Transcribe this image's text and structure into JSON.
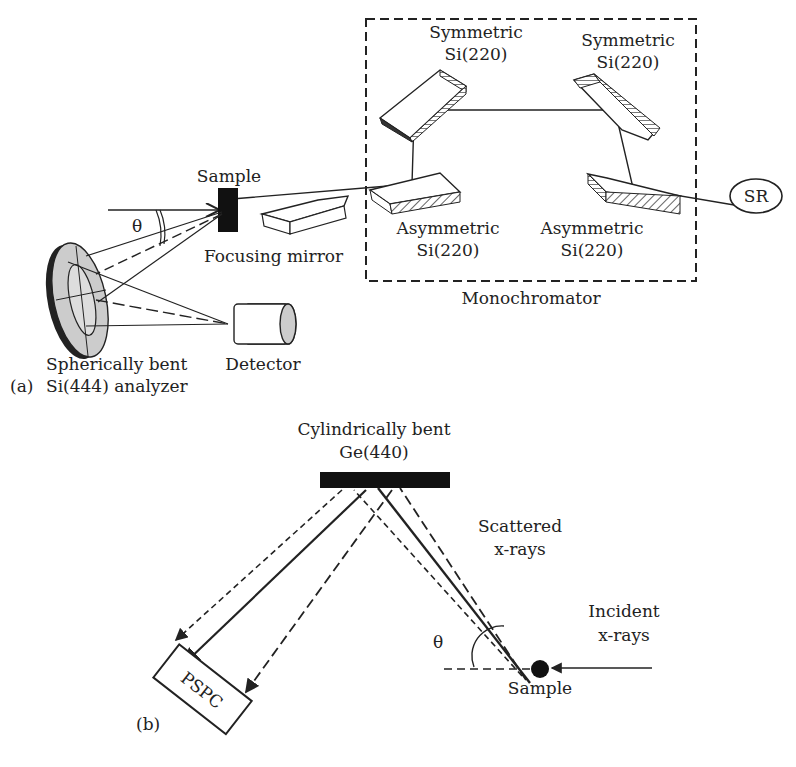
{
  "panel_a": {
    "tag": "(a)",
    "monochromator": {
      "title": "Monochromator",
      "sym1": [
        "Symmetric",
        "Si(220)"
      ],
      "sym2": [
        "Symmetric",
        "Si(220)"
      ],
      "asym1": [
        "Asymmetric",
        "Si(220)"
      ],
      "asym2": [
        "Asymmetric",
        "Si(220)"
      ]
    },
    "source": "SR",
    "sample": "Sample",
    "theta": "θ",
    "mirror": "Focusing  mirror",
    "detector": "Detector",
    "analyzer": [
      "Spherically bent",
      "Si(444) analyzer"
    ]
  },
  "panel_b": {
    "tag": "(b)",
    "crystal": [
      "Cylindrically bent",
      "Ge(440)"
    ],
    "scattered": [
      "Scattered",
      "x-rays"
    ],
    "incident": [
      "Incident",
      "x-rays"
    ],
    "theta": "θ",
    "sample": "Sample",
    "detector": "PSPC"
  }
}
